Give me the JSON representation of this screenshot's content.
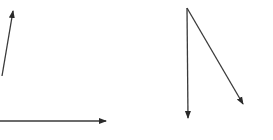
{
  "diagram": {
    "background": "#ffffff",
    "stroke_color": "#3a3a3a",
    "arrowhead_color": "#2a2a2a",
    "left_figure": {
      "arrows": [
        {
          "name": "vector-a-upward",
          "x1": 2,
          "y1": 76,
          "x2": 13,
          "y2": 11
        },
        {
          "name": "vector-b-horizontal",
          "x1": 0,
          "y1": 121,
          "x2": 106,
          "y2": 121
        }
      ]
    },
    "right_figure": {
      "origin": {
        "x": 187,
        "y": 8
      },
      "arrows": [
        {
          "name": "vector-c-down",
          "x1": 187,
          "y1": 8,
          "x2": 188,
          "y2": 118
        },
        {
          "name": "vector-d-diagonal",
          "x1": 187,
          "y1": 8,
          "x2": 243,
          "y2": 104
        }
      ]
    }
  }
}
